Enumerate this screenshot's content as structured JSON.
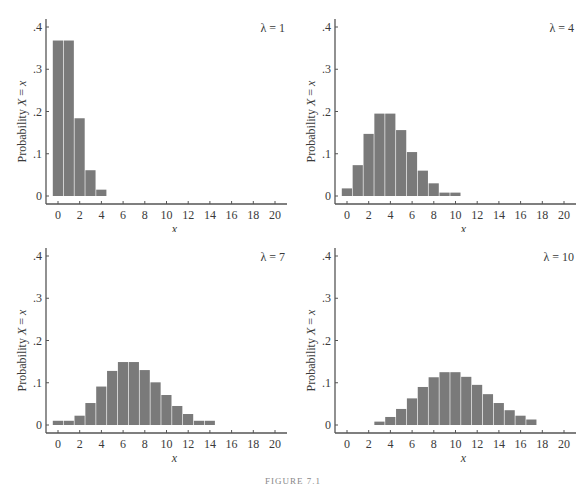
{
  "figure": {
    "caption": "FIGURE 7.1",
    "bar_color": "#7a7a7a",
    "axis_color": "#555555"
  },
  "chart_data": [
    {
      "type": "bar",
      "title": "λ = 1",
      "xlabel": "x",
      "ylabel": "Probability X = x",
      "xlim": [
        0,
        20
      ],
      "ylim": [
        0,
        0.4
      ],
      "xticks": [
        "0",
        "2",
        "4",
        "6",
        "8",
        "10",
        "12",
        "14",
        "16",
        "18",
        "20"
      ],
      "yticks": [
        "0",
        ".1",
        ".2",
        ".3",
        ".4"
      ],
      "x": [
        0,
        1,
        2,
        3,
        4
      ],
      "values": [
        0.368,
        0.368,
        0.184,
        0.061,
        0.015
      ]
    },
    {
      "type": "bar",
      "title": "λ = 4",
      "xlabel": "x",
      "ylabel": "Probability X = x",
      "xlim": [
        0,
        20
      ],
      "ylim": [
        0,
        0.4
      ],
      "xticks": [
        "0",
        "2",
        "4",
        "6",
        "8",
        "10",
        "12",
        "14",
        "16",
        "18",
        "20"
      ],
      "yticks": [
        "0",
        ".1",
        ".2",
        ".3",
        ".4"
      ],
      "x": [
        0,
        1,
        2,
        3,
        4,
        5,
        6,
        7,
        8,
        9,
        10
      ],
      "values": [
        0.018,
        0.073,
        0.147,
        0.195,
        0.195,
        0.156,
        0.104,
        0.06,
        0.03,
        0.008,
        0.008
      ]
    },
    {
      "type": "bar",
      "title": "λ = 7",
      "xlabel": "x",
      "ylabel": "Probability X = x",
      "xlim": [
        0,
        20
      ],
      "ylim": [
        0,
        0.4
      ],
      "xticks": [
        "0",
        "2",
        "4",
        "6",
        "8",
        "10",
        "12",
        "14",
        "16",
        "18",
        "20"
      ],
      "yticks": [
        "0",
        ".1",
        ".2",
        ".3",
        ".4"
      ],
      "x": [
        0,
        1,
        2,
        3,
        4,
        5,
        6,
        7,
        8,
        9,
        10,
        11,
        12,
        13,
        14
      ],
      "values": [
        0.01,
        0.01,
        0.022,
        0.052,
        0.091,
        0.128,
        0.149,
        0.149,
        0.13,
        0.101,
        0.071,
        0.045,
        0.026,
        0.01,
        0.01
      ]
    },
    {
      "type": "bar",
      "title": "λ = 10",
      "xlabel": "x",
      "ylabel": "Probability X = x",
      "xlim": [
        0,
        20
      ],
      "ylim": [
        0,
        0.4
      ],
      "xticks": [
        "0",
        "2",
        "4",
        "6",
        "8",
        "10",
        "12",
        "14",
        "16",
        "18",
        "20"
      ],
      "yticks": [
        "0",
        ".1",
        ".2",
        ".3",
        ".4"
      ],
      "x": [
        3,
        4,
        5,
        6,
        7,
        8,
        9,
        10,
        11,
        12,
        13,
        14,
        15,
        16,
        17
      ],
      "values": [
        0.008,
        0.019,
        0.038,
        0.063,
        0.09,
        0.113,
        0.125,
        0.125,
        0.114,
        0.095,
        0.073,
        0.052,
        0.035,
        0.022,
        0.013
      ]
    }
  ]
}
